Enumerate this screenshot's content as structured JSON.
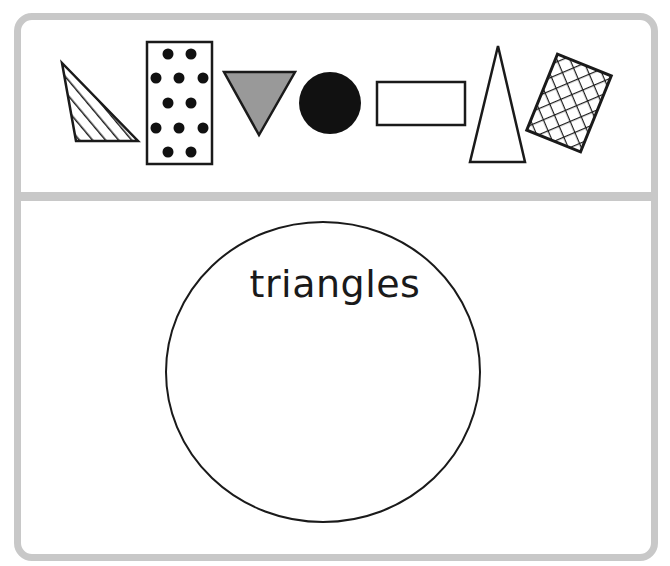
{
  "shape_bank": {
    "shapes": [
      {
        "id": "right-triangle-striped",
        "kind": "triangle",
        "fill": "diagonal-stripes"
      },
      {
        "id": "rectangle-dotted",
        "kind": "rectangle",
        "fill": "dots"
      },
      {
        "id": "inverted-triangle-gray",
        "kind": "triangle",
        "fill": "#999999"
      },
      {
        "id": "circle-black",
        "kind": "circle",
        "fill": "#111111"
      },
      {
        "id": "rectangle-plain",
        "kind": "rectangle",
        "fill": "none"
      },
      {
        "id": "isosceles-triangle-plain",
        "kind": "triangle",
        "fill": "none"
      },
      {
        "id": "rectangle-crosshatch-rotated",
        "kind": "rectangle",
        "fill": "crosshatch"
      }
    ]
  },
  "sorting_area": {
    "circle_label": "triangles"
  },
  "colors": {
    "frame": "#c8c8c8",
    "stroke": "#1a1a1a",
    "gray_fill": "#999999"
  }
}
